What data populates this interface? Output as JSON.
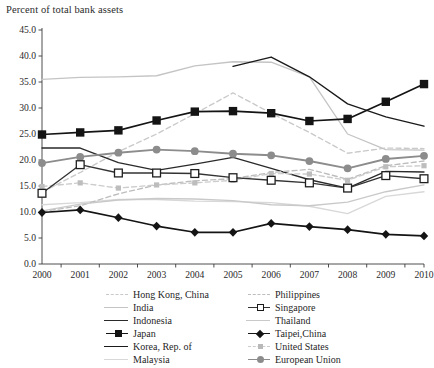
{
  "chart_data": {
    "type": "line",
    "title": "Percent of total bank assets",
    "xlabel": "",
    "ylabel": "Percent of total bank assets",
    "x": [
      2000,
      2001,
      2002,
      2003,
      2004,
      2005,
      2006,
      2007,
      2008,
      2009,
      2010
    ],
    "xtick_labels": [
      "2000",
      "2001",
      "2002",
      "2003",
      "2004",
      "2005",
      "2006",
      "2007",
      "2008",
      "2009",
      "2010"
    ],
    "ytick_labels": [
      "0.0",
      "5.0",
      "10.0",
      "15.0",
      "20.0",
      "25.0",
      "30.0",
      "35.0",
      "40.0",
      "45.0"
    ],
    "yticks": [
      0.0,
      5.0,
      10.0,
      15.0,
      20.0,
      25.0,
      30.0,
      35.0,
      40.0,
      45.0
    ],
    "ylim": [
      0.0,
      45.0
    ],
    "xlim": [
      2000,
      2010
    ],
    "grid": false,
    "legend_position": "bottom",
    "series": [
      {
        "name": "Hong Kong, China",
        "color": "#c9c9c9",
        "style": "dashed",
        "marker": "none",
        "values": [
          13.8,
          17.6,
          21.6,
          25.0,
          28.9,
          32.9,
          29.0,
          25.3,
          21.3,
          22.3,
          22.2
        ]
      },
      {
        "name": "India",
        "color": "#c4c4c4",
        "style": "solid",
        "marker": "none",
        "values": [
          35.5,
          35.9,
          36.0,
          36.2,
          38.1,
          38.9,
          38.8,
          36.0,
          25.0,
          22.0,
          21.9
        ]
      },
      {
        "name": "Indonesia",
        "color": "#2a2a2a",
        "style": "solid",
        "marker": "none",
        "values": [
          22.3,
          22.3,
          19.5,
          18.0,
          19.2,
          20.5,
          18.4,
          16.2,
          14.6,
          17.8,
          17.7
        ]
      },
      {
        "name": "Japan",
        "color": "#141414",
        "style": "solid",
        "marker": "square-filled",
        "values": [
          24.9,
          25.3,
          25.7,
          27.6,
          29.3,
          29.4,
          29.0,
          27.5,
          27.9,
          31.2,
          34.6
        ]
      },
      {
        "name": "Korea, Rep. of",
        "color": "#1a1a1a",
        "style": "solid",
        "marker": "none",
        "values": [
          null,
          null,
          null,
          null,
          null,
          38.0,
          39.8,
          36.0,
          30.8,
          28.3,
          26.5
        ]
      },
      {
        "name": "Malaysia",
        "color": "#d8d8d8",
        "style": "solid",
        "marker": "none",
        "values": [
          11.4,
          11.8,
          12.4,
          12.4,
          12.1,
          12.0,
          11.8,
          11.1,
          9.7,
          13.0,
          13.9
        ]
      },
      {
        "name": "Philippines",
        "color": "#bdbdbd",
        "style": "dashed",
        "marker": "none",
        "values": [
          10.1,
          11.2,
          13.5,
          15.2,
          16.0,
          16.4,
          17.6,
          18.2,
          16.3,
          18.9,
          19.8
        ]
      },
      {
        "name": "Singapore",
        "color": "#333333",
        "style": "solid",
        "marker": "square-open",
        "values": [
          13.6,
          19.1,
          17.5,
          17.5,
          17.4,
          16.6,
          16.1,
          15.6,
          14.6,
          17.0,
          16.4
        ]
      },
      {
        "name": "Thailand",
        "color": "#c9c9c9",
        "style": "solid",
        "marker": "none",
        "values": [
          10.2,
          11.5,
          12.3,
          12.6,
          12.5,
          12.2,
          11.4,
          11.2,
          11.9,
          13.9,
          15.2
        ]
      },
      {
        "name": "Taipei,China",
        "color": "#141414",
        "style": "solid",
        "marker": "diamond",
        "values": [
          9.9,
          10.4,
          8.9,
          7.3,
          6.1,
          6.1,
          7.8,
          7.2,
          6.6,
          5.7,
          5.4
        ]
      },
      {
        "name": "United States",
        "color": "#cccccc",
        "style": "dashed",
        "marker": "tiny-square",
        "values": [
          14.9,
          15.6,
          14.6,
          15.2,
          15.6,
          16.1,
          17.4,
          17.3,
          16.1,
          18.7,
          18.9
        ]
      },
      {
        "name": "European Union",
        "color": "#8c8c8c",
        "style": "solid",
        "marker": "circle",
        "values": [
          19.4,
          20.6,
          21.4,
          22.0,
          21.7,
          21.2,
          20.9,
          19.8,
          18.4,
          20.2,
          20.8
        ]
      }
    ]
  },
  "legend": {
    "left_column": [
      {
        "label": "Hong Kong, China",
        "series": "Hong Kong, China"
      },
      {
        "label": "India",
        "series": "India"
      },
      {
        "label": "Indonesia",
        "series": "Indonesia"
      },
      {
        "label": "Japan",
        "series": "Japan"
      },
      {
        "label": "Korea, Rep. of",
        "series": "Korea, Rep. of"
      },
      {
        "label": "Malaysia",
        "series": "Malaysia"
      }
    ],
    "right_column": [
      {
        "label": "Philippines",
        "series": "Philippines"
      },
      {
        "label": "Singapore",
        "series": "Singapore"
      },
      {
        "label": "Thailand",
        "series": "Thailand"
      },
      {
        "label": "Taipei,China",
        "series": "Taipei,China"
      },
      {
        "label": "United States",
        "series": "United States"
      },
      {
        "label": "European Union",
        "series": "European Union"
      }
    ]
  },
  "axes": {
    "plot_left": 42,
    "plot_right": 424,
    "plot_top": 30,
    "plot_bottom": 264
  }
}
